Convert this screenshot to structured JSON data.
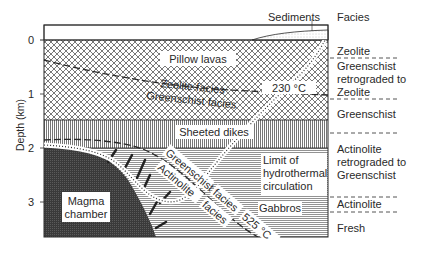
{
  "header": {
    "sediments_label": "Sediments",
    "facies_header": "Facies"
  },
  "axis": {
    "label": "Depth (km)",
    "ticks": [
      {
        "label": "0",
        "y": 40
      },
      {
        "label": "1",
        "y": 94
      },
      {
        "label": "2",
        "y": 148
      },
      {
        "label": "3",
        "y": 202
      }
    ]
  },
  "layers": {
    "pillow_lavas": "Pillow lavas",
    "sheeted_dikes": "Sheeted dikes",
    "gabbros": "Gabbros",
    "magma_chamber_line1": "Magma",
    "magma_chamber_line2": "chamber"
  },
  "boundaries": {
    "zeolite_facies": "Zeolite   facies",
    "greenschist_facies_upper": "Greenschist facies",
    "temp_230": "230 °C",
    "greenschist_facies_lower_a": "Greenschist",
    "greenschist_facies_lower_b": "facies",
    "actinolite_facies_a": "Actinolite",
    "actinolite_facies_b": "facies",
    "temp_525": "525 °C",
    "limit_line1": "Limit of",
    "limit_line2": "hydrothermal",
    "limit_line3": "circulation"
  },
  "facies_column": {
    "zeolite": "Zeolite",
    "gs_retro_line1": "Greenschist",
    "gs_retro_line2": "retrograded to",
    "gs_retro_line3": "Zeolite",
    "greenschist": "Greenschist",
    "act_retro_line1": "Actinolite",
    "act_retro_line2": "retrograded to",
    "act_retro_line3": "Greenschist",
    "actinolite": "Actinolite",
    "fresh": "Fresh"
  },
  "colors": {
    "ink": "#2a2a2a",
    "magma": "#3a3a3a",
    "background": "#ffffff"
  }
}
